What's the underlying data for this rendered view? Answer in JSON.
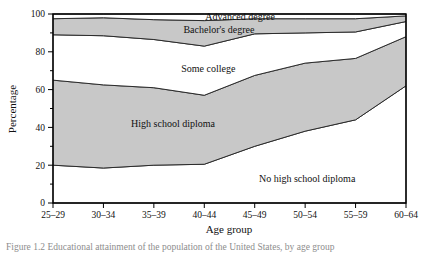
{
  "figure": {
    "caption": "Figure 1.2  Educational attainment of the population of the United States, by age group"
  },
  "chart_data": {
    "type": "area",
    "title": "",
    "subtitle": "",
    "xlabel": "Age group",
    "ylabel": "Percentage",
    "ylim": [
      0,
      100
    ],
    "yticks": [
      0,
      20,
      40,
      60,
      80,
      100
    ],
    "ytick_labels": [
      "0",
      "20",
      "40",
      "60",
      "80",
      "100"
    ],
    "grid": false,
    "legend_position": "inline-band-labels",
    "stacked": true,
    "categories": [
      "25–29",
      "30–34",
      "35–39",
      "40–44",
      "45–49",
      "50–54",
      "55–59",
      "60–64"
    ],
    "series": [
      {
        "name": "No high school diploma",
        "fill": "white",
        "values": [
          20,
          18.5,
          20,
          20.5,
          30,
          38,
          44,
          62
        ],
        "cumulative_top": [
          20,
          18.5,
          20,
          20.5,
          30,
          38,
          44,
          62
        ],
        "label_x_fraction": 0.72,
        "label_y_value": 13
      },
      {
        "name": "High school diploma",
        "fill": "shaded",
        "values": [
          45,
          44,
          41,
          36.5,
          37.5,
          36,
          32.5,
          26
        ],
        "cumulative_top": [
          65,
          62.5,
          61,
          57,
          67.5,
          74,
          76.5,
          88
        ],
        "label_x_fraction": 0.34,
        "label_y_value": 42
      },
      {
        "name": "Some college",
        "fill": "white",
        "values": [
          24,
          26,
          25.5,
          26,
          22,
          16,
          14,
          8
        ],
        "cumulative_top": [
          89,
          88.5,
          86.5,
          83,
          89.5,
          90,
          90.5,
          96
        ],
        "label_x_fraction": 0.44,
        "label_y_value": 71
      },
      {
        "name": "Bachelor's degree",
        "fill": "shaded",
        "values": [
          8.5,
          9.5,
          10.5,
          13.5,
          8,
          7.5,
          7,
          3
        ],
        "cumulative_top": [
          97.5,
          98,
          97,
          96.5,
          97.5,
          97.5,
          97.5,
          99
        ],
        "label_x_fraction": 0.47,
        "label_y_value": 92
      },
      {
        "name": "Advanced degree",
        "fill": "white",
        "values": [
          2.5,
          2,
          3,
          3.5,
          2.5,
          2.5,
          2.5,
          1
        ],
        "cumulative_top": [
          100,
          100,
          100,
          100,
          100,
          100,
          100,
          100
        ],
        "label_x_fraction": 0.53,
        "label_y_value": 98.5
      }
    ]
  }
}
